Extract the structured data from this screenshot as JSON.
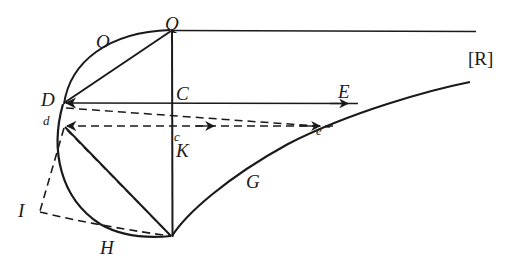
{
  "figure": {
    "background_color": "#ffffff",
    "stroke_color": "#1a1a1a",
    "label_color": "#1a1a1a",
    "width": 509,
    "height": 258,
    "labels": [
      {
        "key": "Q",
        "text": "Q",
        "x": 165,
        "y": 14,
        "size": "cap",
        "style": "italic"
      },
      {
        "key": "O",
        "text": "O",
        "x": 96,
        "y": 32,
        "size": "cap",
        "style": "italic"
      },
      {
        "key": "R",
        "text": "[R]",
        "x": 468,
        "y": 49,
        "size": "brk",
        "style": "roman"
      },
      {
        "key": "C",
        "text": "C",
        "x": 176,
        "y": 84,
        "size": "cap",
        "style": "italic"
      },
      {
        "key": "E",
        "text": "E",
        "x": 338,
        "y": 82,
        "size": "cap",
        "style": "italic"
      },
      {
        "key": "D",
        "text": "D",
        "x": 41,
        "y": 90,
        "size": "cap",
        "style": "italic"
      },
      {
        "key": "d",
        "text": "d",
        "x": 43,
        "y": 114,
        "size": "small",
        "style": "italic"
      },
      {
        "key": "c",
        "text": "c",
        "x": 174,
        "y": 130,
        "size": "small",
        "style": "italic"
      },
      {
        "key": "e",
        "text": "e",
        "x": 316,
        "y": 124,
        "size": "small",
        "style": "italic"
      },
      {
        "key": "K",
        "text": "K",
        "x": 176,
        "y": 141,
        "size": "cap",
        "style": "italic"
      },
      {
        "key": "G",
        "text": "G",
        "x": 246,
        "y": 172,
        "size": "cap",
        "style": "italic"
      },
      {
        "key": "I",
        "text": "I",
        "x": 18,
        "y": 201,
        "size": "cap",
        "style": "italic"
      },
      {
        "key": "H",
        "text": "H",
        "x": 100,
        "y": 238,
        "size": "cap",
        "style": "italic"
      }
    ],
    "points": {
      "Q": {
        "x": 172,
        "y": 30
      },
      "D": {
        "x": 62,
        "y": 103
      },
      "d": {
        "x": 63,
        "y": 126
      },
      "C": {
        "x": 172,
        "y": 103
      },
      "c": {
        "x": 172,
        "y": 126
      },
      "E": {
        "x": 356,
        "y": 103
      },
      "e": {
        "x": 330,
        "y": 126
      },
      "bottom": {
        "x": 172,
        "y": 236
      },
      "I": {
        "x": 40,
        "y": 212
      },
      "H": {
        "x": 112,
        "y": 229
      },
      "line_top_right": {
        "x": 476,
        "y": 31
      },
      "curve_right_end": {
        "x": 470,
        "y": 82
      }
    },
    "elements": [
      {
        "name": "arc-D-Q",
        "kind": "solid-arc",
        "from": "D",
        "to": "Q"
      },
      {
        "name": "chord-D-Q",
        "kind": "solid-line",
        "from": "D",
        "to": "Q"
      },
      {
        "name": "line-Q-right",
        "kind": "solid-line",
        "from": "Q",
        "to": "line_top_right"
      },
      {
        "name": "vertical-Q-bottom",
        "kind": "solid-line",
        "from": "Q",
        "to": "bottom"
      },
      {
        "name": "line-D-E",
        "kind": "solid-arrow",
        "from": "E",
        "to": "D"
      },
      {
        "name": "dashed-d-e",
        "kind": "dashed-arrow",
        "from": "e",
        "to": "d"
      },
      {
        "name": "dashed-D-c",
        "kind": "dashed-line",
        "from": "D",
        "to": "c"
      },
      {
        "name": "dashed-c-e",
        "kind": "dashed-line",
        "from": "c",
        "to": "e"
      },
      {
        "name": "curve-G",
        "kind": "solid-curve",
        "from": "bottom",
        "to": "curve_right_end"
      },
      {
        "name": "arc-D-H-bottom",
        "kind": "solid-arc",
        "from": "D",
        "to": "bottom"
      },
      {
        "name": "chord-d-bottom",
        "kind": "solid-line",
        "from": "d",
        "to": "bottom"
      },
      {
        "name": "dashed-d-bottom",
        "kind": "dashed-line",
        "from": "d",
        "to": "bottom"
      },
      {
        "name": "dashed-d-I",
        "kind": "dashed-line",
        "from": "d",
        "to": "I"
      },
      {
        "name": "dashed-I-bottom",
        "kind": "dashed-line",
        "from": "I",
        "to": "bottom"
      }
    ]
  }
}
